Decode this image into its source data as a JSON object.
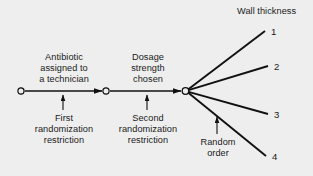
{
  "figure": {
    "background_color": "#eeeeee",
    "line_color": "#111111",
    "text_color": "#1a1a1a",
    "nodes": [
      {
        "name": "start-node",
        "x": 21,
        "y": 91
      },
      {
        "name": "middle-node",
        "x": 106,
        "y": 91
      },
      {
        "name": "fan-node",
        "x": 185,
        "y": 91
      }
    ],
    "stage_labels": {
      "stage_one_top": "Antibiotic\nassigned to\na technician",
      "stage_two_top": "Dosage\nstrength\nchosen",
      "stage_one_bottom": "First\nrandomization\nrestriction",
      "stage_two_bottom": "Second\nrandomization\nrestriction",
      "fan_bottom": "Random\norder"
    },
    "response_title": "Wall thickness",
    "response_levels": [
      "1",
      "2",
      "3",
      "4"
    ],
    "fan_endpoints": [
      {
        "label": "1",
        "x": 265,
        "y": 31
      },
      {
        "label": "2",
        "x": 268,
        "y": 66
      },
      {
        "label": "3",
        "x": 268,
        "y": 114
      },
      {
        "label": "4",
        "x": 266,
        "y": 156
      }
    ],
    "label_positions": [
      {
        "label": "1",
        "x": 271,
        "y": 27
      },
      {
        "label": "2",
        "x": 274,
        "y": 62
      },
      {
        "label": "3",
        "x": 274,
        "y": 110
      },
      {
        "label": "4",
        "x": 272,
        "y": 152
      }
    ]
  }
}
